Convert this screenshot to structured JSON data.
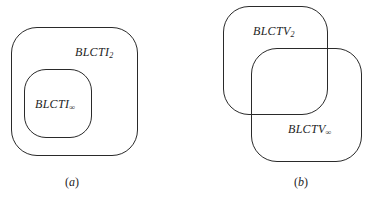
{
  "panels": [
    {
      "id": "a",
      "caption": "a",
      "relation": "containment",
      "sets": [
        {
          "name": "outer",
          "label_base": "BLCTI",
          "label_sub": "2"
        },
        {
          "name": "inner",
          "label_base": "BLCTI",
          "label_sub": "∞"
        }
      ]
    },
    {
      "id": "b",
      "caption": "b",
      "relation": "overlap",
      "sets": [
        {
          "name": "upper-left",
          "label_base": "BLCTV",
          "label_sub": "2"
        },
        {
          "name": "lower-right",
          "label_base": "BLCTV",
          "label_sub": "∞"
        }
      ]
    }
  ],
  "colors": {
    "stroke": "#2a2a2a",
    "text": "#1e1e1e",
    "background": "#ffffff"
  }
}
